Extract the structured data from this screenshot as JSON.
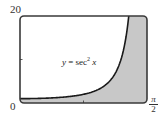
{
  "chart_data": {
    "type": "area",
    "title": "",
    "function": "y = sec^2 x",
    "annotation": {
      "prefix": "y",
      "equals": " = sec",
      "exponent": "2",
      "suffix": " x"
    },
    "xlabel": "",
    "ylabel": "",
    "xlim": [
      0,
      1.5708
    ],
    "ylim": [
      0,
      20
    ],
    "x_tick_labels": {
      "start": "0",
      "end_numerator": "π",
      "end_denominator": "2"
    },
    "y_tick_labels": {
      "top": "20"
    },
    "y_minor_ticks": [
      10
    ],
    "x_minor_ticks": [
      0.785
    ],
    "grid": false,
    "shaded_region": "area between curve and x-axis to the right of the curve",
    "series": [
      {
        "name": "sec^2 x",
        "x": [
          0,
          0.2,
          0.4,
          0.6,
          0.8,
          1.0,
          1.1,
          1.2,
          1.25,
          1.3,
          1.3453
        ],
        "values": [
          1.0,
          1.04,
          1.18,
          1.47,
          2.06,
          3.43,
          4.95,
          7.6,
          10.0,
          14.1,
          20.0
        ]
      }
    ],
    "colors": {
      "curve": "#1a1a1a",
      "fill": "#c8c8c8",
      "frame": "#3a3a3a",
      "background": "#ffffff"
    }
  }
}
